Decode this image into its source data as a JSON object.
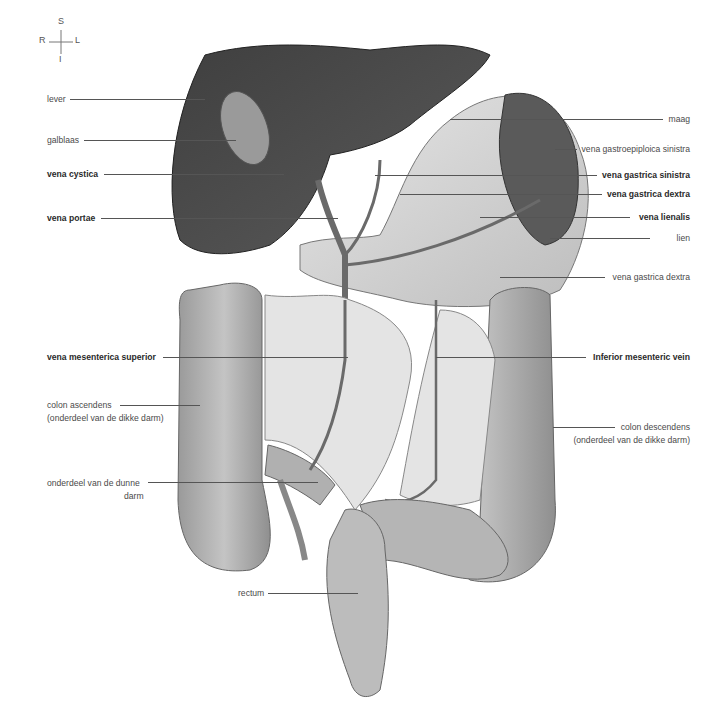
{
  "compass": {
    "superior": "S",
    "inferior": "I",
    "right": "R",
    "left": "L"
  },
  "labels_left": [
    {
      "id": "lever",
      "text": "lever",
      "bold": false
    },
    {
      "id": "galblaas",
      "text": "galblaas",
      "bold": false
    },
    {
      "id": "vena-cystica",
      "text": "vena cystica",
      "bold": true
    },
    {
      "id": "vena-portae",
      "text": "vena portae",
      "bold": true
    },
    {
      "id": "vena-mesenterica-superior",
      "text": "vena mesenterica superior",
      "bold": true
    },
    {
      "id": "colon-ascendens",
      "text": "colon ascendens",
      "text2": "(onderdeel van de dikke darm)",
      "bold": false
    },
    {
      "id": "dunne-darm",
      "text": "onderdeel van de dunne",
      "text2": "darm",
      "bold": false
    },
    {
      "id": "rectum",
      "text": "rectum",
      "bold": false
    }
  ],
  "labels_right": [
    {
      "id": "maag",
      "text": "maag",
      "bold": false
    },
    {
      "id": "vena-gastroepiploica-sinistra",
      "text": "vena gastroepiploica sinistra",
      "bold": false
    },
    {
      "id": "vena-gastrica-sinistra",
      "text": "vena gastrica sinistra",
      "bold": true
    },
    {
      "id": "vena-gastrica-dextra",
      "text": "vena gastrica dextra",
      "bold": true
    },
    {
      "id": "vena-lienalis",
      "text": "vena lienalis",
      "bold": true
    },
    {
      "id": "lien",
      "text": "lien",
      "bold": false
    },
    {
      "id": "vena-gastrica-dextra-2",
      "text": "vena gastrica dextra",
      "bold": false
    },
    {
      "id": "inferior-mesenteric-vein",
      "text": "Inferior mesenteric vein",
      "bold": true
    },
    {
      "id": "colon-descendens",
      "text": "colon descendens",
      "text2": "(onderdeel van de dikke darm)",
      "bold": false
    }
  ],
  "colors": {
    "liver": "#4a4a4a",
    "stomach": "#cfcfcf",
    "vein": "#6a6a6a",
    "colon": "#a9a9a9",
    "spleen": "#555555",
    "line": "#555555"
  }
}
